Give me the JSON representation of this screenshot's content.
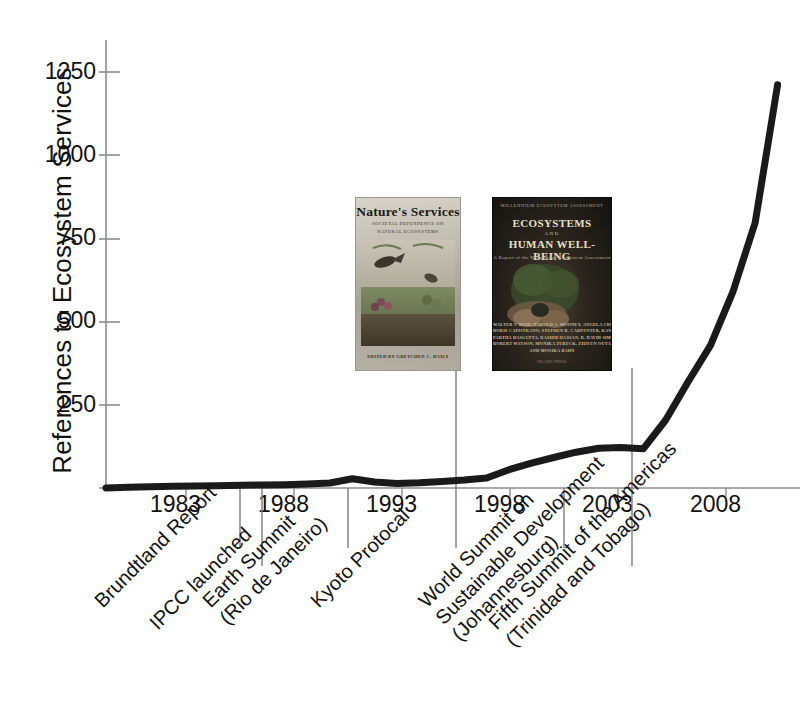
{
  "chart_data": {
    "type": "line",
    "title": "",
    "xlabel": "",
    "ylabel": "References to Ecosystem Services",
    "xlim": [
      1981,
      2012
    ],
    "ylim": [
      0,
      1350
    ],
    "grid": false,
    "legend": "none",
    "xticks": [
      "1983",
      "1988",
      "1993",
      "1998",
      "2003",
      "2008"
    ],
    "xtick_values": [
      1983,
      1988,
      1993,
      1998,
      2003,
      2008
    ],
    "yticks": [
      "250",
      "500",
      "750",
      "1000",
      "1250"
    ],
    "ytick_values": [
      250,
      500,
      750,
      1000,
      1250
    ],
    "x": [
      1981,
      1982,
      1983,
      1984,
      1985,
      1986,
      1987,
      1988,
      1989,
      1990,
      1991,
      1992,
      1993,
      1994,
      1995,
      1996,
      1997,
      1998,
      1999,
      2000,
      2001,
      2002,
      2003,
      2004,
      2005,
      2006,
      2007,
      2008,
      2009,
      2010,
      2011
    ],
    "values": [
      0,
      2,
      4,
      5,
      6,
      7,
      8,
      9,
      10,
      12,
      15,
      28,
      18,
      14,
      16,
      20,
      24,
      30,
      55,
      75,
      92,
      108,
      120,
      122,
      118,
      205,
      320,
      430,
      590,
      800,
      1215
    ],
    "series": [
      {
        "name": "References to Ecosystem Services",
        "values": [
          0,
          2,
          4,
          5,
          6,
          7,
          8,
          9,
          10,
          12,
          15,
          28,
          18,
          14,
          16,
          20,
          24,
          30,
          55,
          75,
          92,
          108,
          120,
          122,
          118,
          205,
          320,
          430,
          590,
          800,
          1215
        ]
      }
    ],
    "line_color": "#1a1a1a",
    "line_width": 7,
    "axis_color": "#8a8a8a"
  },
  "annotations": [
    {
      "id": "brundtland",
      "year": 1987,
      "lines": [
        "Brundtland Report"
      ]
    },
    {
      "id": "ipcc",
      "year": 1988,
      "lines": [
        "IPCC launched"
      ]
    },
    {
      "id": "earth-summit",
      "year": 1992,
      "lines": [
        "Earth Summit",
        "(Rio de Janeiro)"
      ]
    },
    {
      "id": "kyoto",
      "year": 1997,
      "lines": [
        "Kyoto Protocal"
      ]
    },
    {
      "id": "wssd",
      "year": 2002,
      "lines": [
        "World Summit on",
        "Sustainable Development",
        "(Johannesburg)"
      ]
    },
    {
      "id": "fifth-summit",
      "year": 2005,
      "lines": [
        "Fifth Summit of the Americas",
        "(Trinidad and Tobago)"
      ]
    }
  ],
  "book_covers": [
    {
      "id": "natures-services",
      "title": "Nature's Services",
      "subtitle_line1": "SOCIETAL DEPENDENCE ON",
      "subtitle_line2": "NATURAL ECOSYSTEMS",
      "editor_line": "EDITED BY GRETCHEN C. DAILY"
    },
    {
      "id": "ecosystems-human-well-being",
      "top_line": "MILLENNIUM ECOSYSTEM ASSESSMENT",
      "title_line1": "ECOSYSTEMS",
      "title_conjunction": "AND",
      "title_line2": "HUMAN WELL-BEING",
      "subtitle": "A Report of the Millennium Ecosystem Assessment",
      "authors": [
        "WALTER V. REID, HAROLD A. MOONEY, ANGELA CROPPER,",
        "DORIS CAPISTRANO, STEPHEN R. CARPENTER, KANCHAN CHOPRA,",
        "PARTHA DASGUPTA, RASHID HASSAN, R. DAVID SIMPSON,",
        "ROBERT WATSON, MONIKA ZURECK, ZHIYUN OUYANG,",
        "AND MONIKA BAHN"
      ],
      "publisher": "ISLAND PRESS"
    }
  ]
}
